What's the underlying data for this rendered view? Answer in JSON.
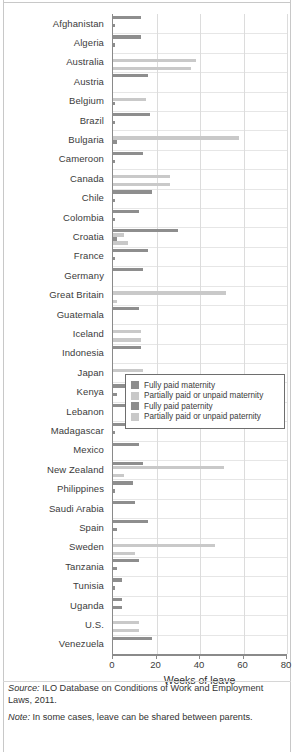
{
  "chart_data": {
    "type": "bar",
    "orientation": "horizontal",
    "title": "",
    "xlabel": "Weeks of leave",
    "ylabel": "",
    "xlim": [
      0,
      80
    ],
    "xticks": [
      0,
      20,
      40,
      60,
      80
    ],
    "grid": true,
    "legend_position": "center-right-overlay",
    "categories": [
      "Afghanistan",
      "Algeria",
      "Australia",
      "Austria",
      "Belgium",
      "Brazil",
      "Bulgaria",
      "Cameroon",
      "Canada",
      "Chile",
      "Colombia",
      "Croatia",
      "France",
      "Germany",
      "Great Britain",
      "Guatemala",
      "Iceland",
      "Indonesia",
      "Japan",
      "Kenya",
      "Lebanon",
      "Madagascar",
      "Mexico",
      "New Zealand",
      "Philippines",
      "Saudi Arabia",
      "Spain",
      "Sweden",
      "Tanzania",
      "Tunisia",
      "Uganda",
      "U.S.",
      "Venezuela"
    ],
    "series": [
      {
        "name": "Fully paid maternity",
        "color": "#8e8e8e",
        "values": [
          13,
          13,
          0,
          16,
          0,
          17,
          0,
          14,
          0,
          18,
          12,
          30,
          16,
          14,
          0,
          12,
          0,
          13,
          0,
          26,
          7,
          14,
          12,
          14,
          9,
          10,
          16,
          0,
          12,
          4,
          4,
          0,
          18
        ]
      },
      {
        "name": "Partially paid or unpaid maternity",
        "color": "#c9c9c9",
        "values": [
          0,
          0,
          38,
          0,
          15,
          0,
          58,
          0,
          26,
          0,
          0,
          5,
          0,
          0,
          52,
          0,
          13,
          0,
          14,
          0,
          0,
          0,
          0,
          51,
          0,
          0,
          0,
          47,
          0,
          0,
          0,
          12,
          0
        ]
      },
      {
        "name": "Fully paid paternity",
        "color": "#8e8e8e",
        "values": [
          1,
          1,
          0,
          0,
          1,
          1,
          2,
          1,
          0,
          1,
          1,
          2,
          1,
          0,
          0,
          0,
          0,
          0,
          0,
          2,
          0,
          1,
          0,
          0,
          1,
          0,
          2,
          0,
          2,
          1,
          4,
          0,
          0
        ]
      },
      {
        "name": "Partially paid or unpaid paternity",
        "color": "#c9c9c9",
        "values": [
          0,
          0,
          36,
          0,
          0,
          0,
          0,
          0,
          26,
          0,
          0,
          7,
          0,
          0,
          2,
          0,
          13,
          0,
          0,
          0,
          0,
          0,
          0,
          5,
          0,
          0,
          0,
          10,
          0,
          0,
          0,
          12,
          0
        ]
      }
    ]
  },
  "legend": {
    "items": [
      {
        "label": "Fully paid maternity"
      },
      {
        "label": "Partially paid or unpaid maternity"
      },
      {
        "label": "Fully paid paternity"
      },
      {
        "label": "Partially paid or unpaid paternity"
      }
    ]
  },
  "footer": {
    "source_word": "Source:",
    "source_text": " ILO Database on Conditions of Work and Employment Laws, 2011.",
    "note_word": "Note:",
    "note_text": " In some cases, leave can be shared between parents."
  }
}
